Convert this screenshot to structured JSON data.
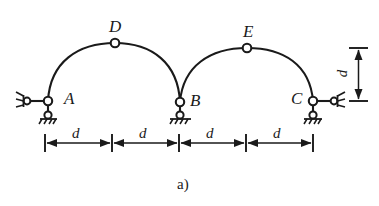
{
  "figure": {
    "caption": "a)",
    "type": "structural-diagram",
    "stroke_color": "#1a1a1a",
    "background_color": "#ffffff"
  },
  "nodes": [
    {
      "id": "A",
      "label": "A",
      "kind": "support-pin-with-link",
      "x": 48,
      "y": 101,
      "label_x": 64,
      "label_y": 92
    },
    {
      "id": "D",
      "label": "D",
      "kind": "crown-hinge",
      "x": 115,
      "y": 43,
      "label_x": 109,
      "label_y": 18
    },
    {
      "id": "B",
      "label": "B",
      "kind": "support-pin-double-hinge",
      "x": 180,
      "y": 102,
      "label_x": 190,
      "label_y": 92
    },
    {
      "id": "E",
      "label": "E",
      "kind": "crown-hinge",
      "x": 247,
      "y": 48,
      "label_x": 243,
      "label_y": 23
    },
    {
      "id": "C",
      "label": "C",
      "kind": "support-pin-with-link",
      "x": 313,
      "y": 101,
      "label_x": 293,
      "label_y": 92
    }
  ],
  "arches": [
    {
      "id": "arch-left",
      "from": "A",
      "crown": "D",
      "to": "B"
    },
    {
      "id": "arch-right",
      "from": "B",
      "crown": "E",
      "to": "C"
    }
  ],
  "dimensions": {
    "horizontal": {
      "label": "d",
      "segments": [
        {
          "id": "seg-1",
          "label": "d",
          "x_start": 45,
          "x_end": 112,
          "label_x": 72,
          "label_y": 128
        },
        {
          "id": "seg-2",
          "label": "d",
          "x_start": 112,
          "x_end": 179,
          "label_x": 139,
          "label_y": 128
        },
        {
          "id": "seg-3",
          "label": "d",
          "x_start": 179,
          "x_end": 246,
          "label_x": 206,
          "label_y": 128
        },
        {
          "id": "seg-4",
          "label": "d",
          "x_start": 246,
          "x_end": 313,
          "label_x": 273,
          "label_y": 128
        }
      ],
      "line_y": 143,
      "tick_half_height": 9
    },
    "vertical": {
      "id": "rise-dimension",
      "label": "d",
      "x": 358,
      "y_top": 48,
      "y_bottom": 101,
      "tick_half_width": 9,
      "label_x": 340,
      "label_y": 67
    }
  },
  "supports": {
    "A": {
      "link_direction": "left",
      "hatch_side": "left",
      "ground_below": true
    },
    "B": {
      "link_direction": "none",
      "hatch_side": "below",
      "ground_below": true
    },
    "C": {
      "link_direction": "right",
      "hatch_side": "right",
      "ground_below": true
    }
  }
}
